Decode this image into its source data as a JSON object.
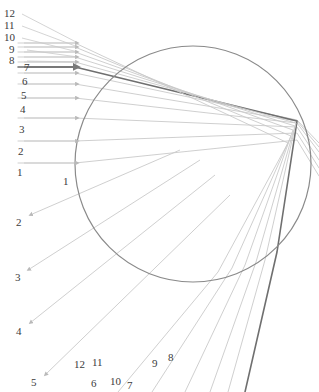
{
  "figure": {
    "type": "ray-diagram",
    "title": "",
    "background": "#ffffff",
    "width": 319,
    "height": 392
  },
  "optic": {
    "shape": "circle",
    "name": "spherical-lens",
    "center_x": 193,
    "center_y": 164,
    "radius": 118,
    "stroke": "#8a8a8a",
    "stroke_width": 1.2,
    "fill": "none"
  },
  "styles": {
    "ray_color": "#c9c9c9",
    "ray_color_mid": "#b4b4b4",
    "highlight_color": "#6f6f6f",
    "label_color": "#3b3b3b",
    "ray_width": 0.9,
    "highlight_width": 1.6
  },
  "incoming": {
    "description": "twelve parallel horizontal rays travelling left to right",
    "arrow_x": 78,
    "start_x": 18,
    "count": 12,
    "ray_y": [
      47,
      52,
      57,
      62,
      67,
      73,
      84,
      98,
      118,
      141,
      163,
      163
    ]
  },
  "chart_data": {
    "type": "line",
    "title": "",
    "xlabel": "",
    "ylabel": "",
    "grid": false,
    "legend": "none",
    "xlim": [
      0,
      319
    ],
    "ylim": [
      392,
      0
    ],
    "circle": {
      "cx": 193,
      "cy": 164,
      "r": 118
    },
    "series": [
      {
        "name": "ray-1",
        "highlight": false,
        "points": [
          [
            18,
            163
          ],
          [
            75,
            163
          ],
          [
            297,
            140
          ],
          [
            319,
            176
          ]
        ]
      },
      {
        "name": "ray-2",
        "highlight": false,
        "points": [
          [
            18,
            141
          ],
          [
            75,
            141
          ],
          [
            297,
            133
          ],
          [
            319,
            168
          ]
        ]
      },
      {
        "name": "ray-3",
        "highlight": false,
        "points": [
          [
            18,
            118
          ],
          [
            75,
            118
          ],
          [
            297,
            127
          ],
          [
            319,
            160
          ]
        ]
      },
      {
        "name": "ray-4",
        "highlight": false,
        "points": [
          [
            18,
            98
          ],
          [
            75,
            98
          ],
          [
            297,
            123
          ],
          [
            319,
            152
          ]
        ]
      },
      {
        "name": "ray-5",
        "highlight": false,
        "points": [
          [
            18,
            84
          ],
          [
            75,
            84
          ],
          [
            297,
            121
          ],
          [
            319,
            147
          ]
        ]
      },
      {
        "name": "ray-6",
        "highlight": false,
        "points": [
          [
            18,
            73
          ],
          [
            75,
            73
          ],
          [
            297,
            120
          ],
          [
            319,
            143
          ]
        ]
      },
      {
        "name": "ray-7",
        "highlight": true,
        "points": [
          [
            18,
            67
          ],
          [
            75,
            67
          ],
          [
            297,
            121
          ],
          [
            277,
            252
          ],
          [
            245,
            392
          ]
        ]
      },
      {
        "name": "ray-8",
        "highlight": false,
        "points": [
          [
            18,
            62
          ],
          [
            75,
            62
          ],
          [
            296,
            123
          ],
          [
            265,
            260
          ],
          [
            228,
            392
          ]
        ]
      },
      {
        "name": "ray-9",
        "highlight": false,
        "points": [
          [
            18,
            57
          ],
          [
            75,
            57
          ],
          [
            295,
            126
          ],
          [
            256,
            262
          ],
          [
            210,
            392
          ]
        ]
      },
      {
        "name": "ray-10",
        "highlight": false,
        "points": [
          [
            18,
            52
          ],
          [
            75,
            52
          ],
          [
            293,
            130
          ],
          [
            245,
            265
          ],
          [
            185,
            392
          ]
        ]
      },
      {
        "name": "ray-11",
        "highlight": false,
        "points": [
          [
            18,
            47
          ],
          [
            75,
            47
          ],
          [
            291,
            136
          ],
          [
            232,
            268
          ],
          [
            152,
            392
          ]
        ]
      },
      {
        "name": "ray-12",
        "highlight": false,
        "points": [
          [
            18,
            43
          ],
          [
            75,
            43
          ],
          [
            288,
            143
          ],
          [
            218,
            272
          ],
          [
            118,
            392
          ]
        ]
      }
    ],
    "entry_labels": [
      "1",
      "2",
      "3",
      "4",
      "5",
      "6",
      "7",
      "8",
      "9",
      "10",
      "11",
      "12"
    ],
    "exit_labels": [
      "1",
      "2",
      "3",
      "4",
      "5",
      "6",
      "7",
      "8",
      "9",
      "10",
      "11",
      "12"
    ]
  },
  "labels": {
    "left_axis": [
      {
        "text": "12",
        "x": 4,
        "y": 8
      },
      {
        "text": "11",
        "x": 4,
        "y": 20
      },
      {
        "text": "10",
        "x": 4,
        "y": 32
      },
      {
        "text": "9",
        "x": 9,
        "y": 44
      },
      {
        "text": "8",
        "x": 9,
        "y": 55
      },
      {
        "text": "7",
        "x": 24,
        "y": 62
      },
      {
        "text": "6",
        "x": 22,
        "y": 76
      },
      {
        "text": "5",
        "x": 21,
        "y": 90
      },
      {
        "text": "4",
        "x": 20,
        "y": 104
      },
      {
        "text": "3",
        "x": 19,
        "y": 124
      },
      {
        "text": "2",
        "x": 18,
        "y": 146
      },
      {
        "text": "1",
        "x": 17,
        "y": 167
      }
    ],
    "inner": [
      {
        "text": "1",
        "x": 63,
        "y": 176
      }
    ],
    "lower_left": [
      {
        "text": "2",
        "x": 16,
        "y": 217
      },
      {
        "text": "3",
        "x": 15,
        "y": 272
      },
      {
        "text": "4",
        "x": 16,
        "y": 326
      },
      {
        "text": "5",
        "x": 31,
        "y": 377
      }
    ],
    "bottom": [
      {
        "text": "12",
        "x": 74,
        "y": 359
      },
      {
        "text": "11",
        "x": 92,
        "y": 357
      },
      {
        "text": "6",
        "x": 91,
        "y": 378
      },
      {
        "text": "10",
        "x": 110,
        "y": 376
      },
      {
        "text": "7",
        "x": 127,
        "y": 380
      },
      {
        "text": "9",
        "x": 152,
        "y": 358
      },
      {
        "text": "8",
        "x": 168,
        "y": 352
      }
    ]
  }
}
